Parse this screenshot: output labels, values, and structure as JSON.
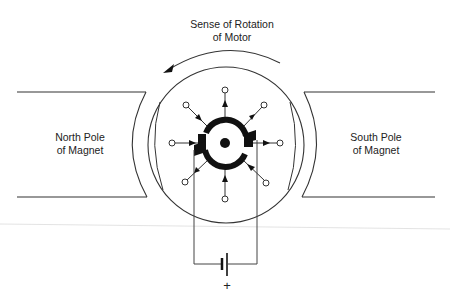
{
  "diagram": {
    "rotation_label": {
      "line1": "Sense of Rotation",
      "line2": "of Motor"
    },
    "north_pole": {
      "line1": "North Pole",
      "line2": "of Magnet"
    },
    "south_pole": {
      "line1": "South Pole",
      "line2": "of Magnet"
    },
    "battery_polarity": "+",
    "colors": {
      "stroke": "#333333",
      "fill": "#111111",
      "faint_line": "#d8d8d8"
    }
  }
}
